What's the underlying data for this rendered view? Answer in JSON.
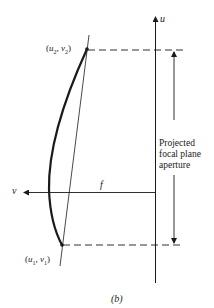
{
  "figure": {
    "caption": "(b)",
    "labels": {
      "u_axis": "u",
      "v_axis": "v",
      "focal_length": "f",
      "point_top": "(u2, v2)",
      "point_bottom": "(u1, v1)",
      "aperture_note": [
        "Projected",
        "focal plane",
        "aperture"
      ]
    },
    "point_top_html": {
      "base": "(",
      "u": "u",
      "u_sub": "2",
      "sep": ", ",
      "v": "v",
      "v_sub": "2",
      "end": ")"
    },
    "point_bottom_html": {
      "base": "(",
      "u": "u",
      "u_sub": "1",
      "sep": ", ",
      "v": "v",
      "v_sub": "1",
      "end": ")"
    },
    "colors": {
      "ink": "#1a1a1a",
      "background": "#ffffff"
    }
  }
}
